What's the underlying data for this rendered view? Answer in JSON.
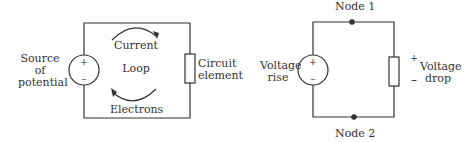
{
  "left_diagram": {
    "source_label": [
      "Source",
      "of",
      "potential"
    ],
    "current_label": "Current",
    "loop_label": "Loop",
    "electrons_label": "Electrons",
    "element_label": [
      "Circuit",
      "element"
    ],
    "plus": "+",
    "minus": "–"
  },
  "right_diagram": {
    "node1_label": "Node 1",
    "node2_label": "Node 2",
    "rise_label": [
      "Voltage",
      "rise"
    ],
    "drop_label": [
      "Voltage",
      "drop"
    ],
    "plus": "+",
    "minus": "–",
    "drop_plus": "+",
    "drop_minus": "–"
  },
  "colors": {
    "line": "#333333"
  }
}
